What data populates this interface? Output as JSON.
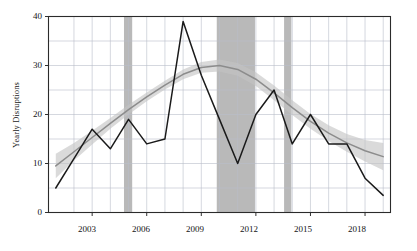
{
  "chart_data": {
    "type": "line",
    "title": "",
    "xlabel": "",
    "ylabel": "Yearly Disruptions",
    "xlim": [
      2000.6,
      2019.4
    ],
    "ylim": [
      0,
      40
    ],
    "grid": true,
    "legend": "none",
    "x": [
      2001,
      2002,
      2003,
      2004,
      2005,
      2006,
      2007,
      2008,
      2009,
      2010,
      2011,
      2012,
      2013,
      2014,
      2015,
      2016,
      2017,
      2018,
      2019
    ],
    "series": [
      {
        "name": "Yearly Disruptions",
        "style": "solid-black-line",
        "color": "#1a1a1a",
        "values": [
          5,
          11,
          17,
          13,
          19,
          14,
          15,
          39,
          28,
          19,
          10,
          20,
          25,
          14,
          20,
          14,
          14,
          7,
          3.5
        ]
      },
      {
        "name": "Smoothed trend",
        "style": "gray-smooth-line",
        "color": "#8c8c8c",
        "values": [
          9.5,
          12.4,
          15.3,
          18.2,
          21.0,
          23.6,
          26.0,
          28.2,
          29.6,
          30.0,
          29.2,
          27.2,
          24.4,
          21.4,
          18.6,
          16.2,
          14.2,
          12.6,
          11.4
        ]
      }
    ],
    "confidence_band": {
      "name": "Confidence interval",
      "color": "#c4c4c4",
      "upper": [
        12.0,
        14.2,
        16.7,
        19.3,
        22.0,
        24.5,
        26.9,
        29.2,
        30.7,
        31.2,
        30.5,
        28.6,
        25.9,
        22.9,
        20.1,
        17.8,
        16.0,
        14.8,
        14.2
      ],
      "lower": [
        7.0,
        10.6,
        13.9,
        17.1,
        20.0,
        22.7,
        25.1,
        27.2,
        28.5,
        28.8,
        27.9,
        25.8,
        22.9,
        19.9,
        17.1,
        14.6,
        12.4,
        10.4,
        8.6
      ]
    },
    "shaded_bands": [
      {
        "name": "band-2005",
        "start": 2004.75,
        "end": 2005.2,
        "color": "#9e9e9e"
      },
      {
        "name": "band-2010-2012",
        "start": 2009.85,
        "end": 2011.95,
        "color": "#9e9e9e"
      },
      {
        "name": "band-2014",
        "start": 2013.55,
        "end": 2013.95,
        "color": "#9e9e9e"
      }
    ],
    "y_major_ticks": [
      0,
      10,
      20,
      30,
      40
    ],
    "y_minor_gridlines": [
      5,
      15,
      25,
      35
    ],
    "x_major_ticks": [
      2003,
      2006,
      2009,
      2012,
      2015,
      2018
    ],
    "x_minor_gridlines": [
      2002,
      2004,
      2005,
      2007,
      2008,
      2010,
      2011,
      2013,
      2014,
      2016,
      2017,
      2019
    ],
    "y_tick_labels": [
      "0",
      "10",
      "20",
      "30",
      "40"
    ],
    "x_tick_labels": [
      "2003",
      "2006",
      "2009",
      "2012",
      "2015",
      "2018"
    ]
  },
  "axes": {
    "ylabel_text": "Yearly Disruptions"
  }
}
